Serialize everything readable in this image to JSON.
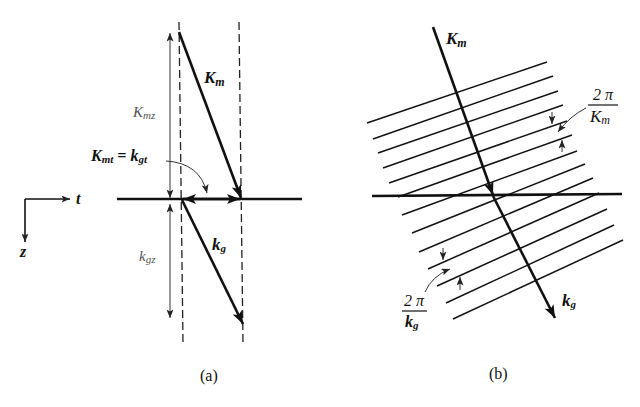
{
  "figure": {
    "panel_a": {
      "caption": "(a)",
      "axis_legend": {
        "horizontal": "t",
        "vertical": "z"
      },
      "vector_Km": {
        "symbol": "K",
        "subscript": "m"
      },
      "vector_kg": {
        "symbol": "k",
        "subscript": "g"
      },
      "component_Kmz": {
        "symbol": "K",
        "subscript": "mz"
      },
      "component_kgz": {
        "symbol": "k",
        "subscript": "gz"
      },
      "phase_matching": {
        "lhs_symbol": "K",
        "lhs_subscript": "mt",
        "operator": " = ",
        "rhs_symbol": "k",
        "rhs_subscript": "gt"
      }
    },
    "panel_b": {
      "caption": "(b)",
      "vector_Km": {
        "symbol": "K",
        "subscript": "m"
      },
      "vector_kg": {
        "symbol": "k",
        "subscript": "g"
      },
      "spacing_Km": {
        "numerator": "2 π",
        "denominator_symbol": "K",
        "denominator_subscript": "m"
      },
      "spacing_kg": {
        "numerator": "2 π",
        "denominator_symbol": "k",
        "denominator_subscript": "g"
      }
    },
    "colors": {
      "ink": "#111111",
      "light_label": "#555555",
      "background": "#ffffff"
    }
  }
}
